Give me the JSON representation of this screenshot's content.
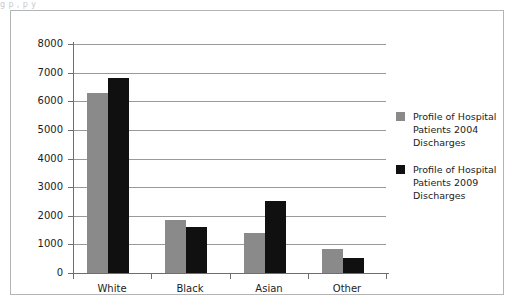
{
  "page": {
    "top_caption_fragment": "g                 p          ,  p      y"
  },
  "chart_data": {
    "type": "bar",
    "title": "",
    "subtitle": "",
    "xlabel": "",
    "ylabel": "",
    "categories": [
      "White",
      "Black",
      "Asian",
      "Other"
    ],
    "series": [
      {
        "name": "Profile of Hospital Patients 2004 Discharges",
        "color": "#8a8a8a",
        "values": [
          6300,
          1850,
          1400,
          840
        ]
      },
      {
        "name": "Profile of Hospital Patients 2009 Discharges",
        "color": "#101010",
        "values": [
          6800,
          1600,
          2500,
          540
        ]
      }
    ],
    "ylim": [
      0,
      8000
    ],
    "ytick_values": [
      0,
      1000,
      2000,
      3000,
      4000,
      5000,
      6000,
      7000,
      8000
    ],
    "ytick_labels": [
      "0",
      "1000",
      "2000",
      "3000",
      "4000",
      "5000",
      "6000",
      "7000",
      "8000"
    ],
    "grid": true,
    "grid_axis": "y",
    "legend_position": "right",
    "legend_entries": [
      {
        "label": "Profile of Hospital Patients 2004 Discharges",
        "lines": [
          "Profile of Hospital",
          "Patients 2004",
          "Discharges"
        ],
        "color": "#8a8a8a"
      },
      {
        "label": "Profile of Hospital Patients 2009 Discharges",
        "lines": [
          "Profile of Hospital",
          "Patients 2009",
          "Discharges"
        ],
        "color": "#101010"
      }
    ]
  }
}
